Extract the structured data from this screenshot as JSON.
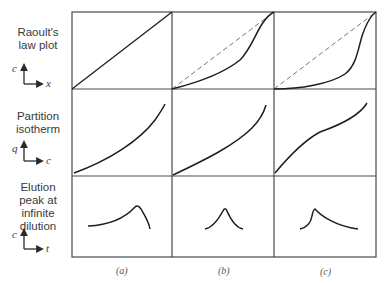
{
  "figure": {
    "rows": [
      {
        "id": "raoult",
        "label": "Raoult's\nlaw plot",
        "y_axis": "c",
        "x_axis": "x"
      },
      {
        "id": "isotherm",
        "label": "Partition\nisotherm",
        "y_axis": "q",
        "x_axis": "c"
      },
      {
        "id": "elution",
        "label": "Elution\npeak at\ninfinite\ndilution",
        "y_axis": "c",
        "x_axis": "t"
      }
    ],
    "columns": [
      {
        "id": "a",
        "label": "(a)"
      },
      {
        "id": "b",
        "label": "(b)"
      },
      {
        "id": "c",
        "label": "(c)"
      }
    ],
    "colors": {
      "grid": "#4a4a4a",
      "curve": "#1e1e1e",
      "dashed": "#777777"
    }
  }
}
